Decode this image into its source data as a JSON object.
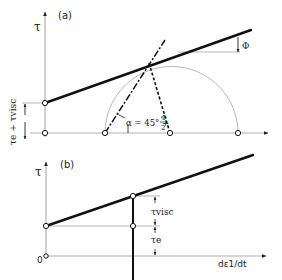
{
  "panel_a": {
    "label": "(a)",
    "y_axis_label": "τ",
    "left_annotation": "τe + τvisc",
    "alpha_label": "α = 45° +",
    "alpha_frac_num": "Φ",
    "alpha_frac_den": "2",
    "phi_label": "Φ"
  },
  "panel_b": {
    "label": "(b)",
    "y_axis_label": "τ",
    "origin_label": "0",
    "x_axis_label": "dε1/dt",
    "tau_visc_label": "τvisc",
    "tau_e_label": "τe"
  },
  "colors": {
    "ink": "#222222",
    "thin": "#888888",
    "background": "#ffffff"
  }
}
